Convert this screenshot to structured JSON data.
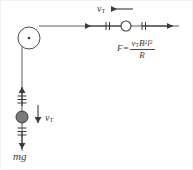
{
  "figure": {
    "background_color": "#ffffff",
    "line_color": "#4a4a4a",
    "ball_fill_color": "#7a7a7a",
    "ball_stroke_color": "#3a3a3a",
    "pulley_stroke_color": "#4a4a4a"
  },
  "labels": {
    "velocity_top": {
      "symbol": "v",
      "subscript": "T"
    },
    "velocity_mass": {
      "symbol": "v",
      "subscript": "T"
    },
    "weight": "mg"
  },
  "formula": {
    "lhs": "F",
    "equals": "=",
    "numerator": {
      "v": "v",
      "v_sub": "T",
      "B": "B",
      "B_exp": "2",
      "l": "l",
      "l_exp": "2"
    },
    "denominator": "R",
    "plain_text": "F = v_T B^2 l^2 / R"
  },
  "elements": {
    "pulley": "pulley-wheel",
    "pulley_axle": "pulley-axle-dot",
    "rod": "sliding-rod-circle",
    "string_horizontal": "horizontal-string",
    "string_vertical": "vertical-string",
    "hanging_mass": "hanging-mass-ball",
    "arrow_left": "leftward-force-arrow",
    "arrow_right": "rightward-force-arrow",
    "arrow_up": "upward-tension-arrow",
    "arrow_down": "downward-weight-arrow",
    "arrow_velocity_top": "top-velocity-arrow",
    "arrow_velocity_mass": "mass-velocity-arrow",
    "hash_marks_left": 2,
    "hash_marks_right": 2,
    "hash_marks_above_ball": 3,
    "hash_marks_below_ball": 3
  },
  "geometry": {
    "pulley_center": [
      28,
      37
    ],
    "pulley_radius": 11,
    "rod_center": [
      125,
      25
    ],
    "rod_radius": 5,
    "ball_center": [
      21,
      116
    ],
    "ball_radius": 6,
    "horizontal_string_y": 25,
    "vertical_string_x": 21
  }
}
